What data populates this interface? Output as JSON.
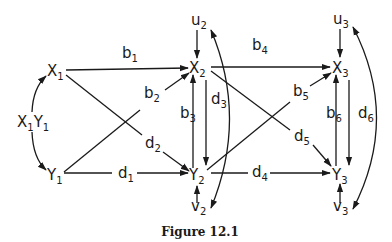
{
  "figure": {
    "caption": "Figure 12.1",
    "nodes": {
      "X1": {
        "main": "X",
        "sub": "1"
      },
      "Y1": {
        "main": "Y",
        "sub": "1"
      },
      "X1Y1_a": {
        "main": "X",
        "sub": "1"
      },
      "X1Y1_b": {
        "main": "Y",
        "sub": "1"
      },
      "X2": {
        "main": "X",
        "sub": "2"
      },
      "Y2": {
        "main": "Y",
        "sub": "2"
      },
      "X3": {
        "main": "X",
        "sub": "3"
      },
      "Y3": {
        "main": "Y",
        "sub": "3"
      },
      "u2": {
        "main": "u",
        "sub": "2"
      },
      "v2": {
        "main": "v",
        "sub": "2"
      },
      "u3": {
        "main": "u",
        "sub": "3"
      },
      "v3": {
        "main": "v",
        "sub": "3"
      }
    },
    "edges": {
      "b1": {
        "main": "b",
        "sub": "1"
      },
      "b2": {
        "main": "b",
        "sub": "2"
      },
      "b3": {
        "main": "b",
        "sub": "3"
      },
      "b4": {
        "main": "b",
        "sub": "4"
      },
      "b5": {
        "main": "b",
        "sub": "5"
      },
      "b6": {
        "main": "b",
        "sub": "6"
      },
      "d1": {
        "main": "d",
        "sub": "1"
      },
      "d2": {
        "main": "d",
        "sub": "2"
      },
      "d3": {
        "main": "d",
        "sub": "3"
      },
      "d4": {
        "main": "d",
        "sub": "4"
      },
      "d5": {
        "main": "d",
        "sub": "5"
      },
      "d6": {
        "main": "d",
        "sub": "6"
      }
    }
  }
}
